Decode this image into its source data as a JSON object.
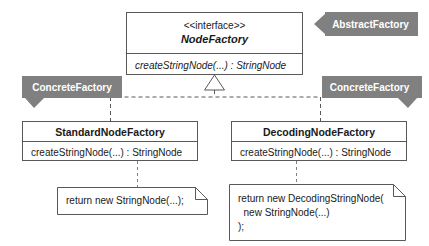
{
  "diagram": {
    "type": "uml-class-diagram",
    "colors": {
      "banner_fill": "#808080",
      "box_stroke": "#595959",
      "background": "#ffffff",
      "text": "#1a1a1a",
      "banner_text": "#ffffff"
    }
  },
  "interface": {
    "stereotype": "<<interface>>",
    "name": "NodeFactory",
    "operations": [
      "createStringNode(...) : StringNode"
    ],
    "role_label": "AbstractFactory"
  },
  "classes": [
    {
      "name": "StandardNodeFactory",
      "operations": [
        "createStringNode(...) : StringNode"
      ],
      "role_label": "ConcreteFactory",
      "note_lines": [
        "return new StringNode(...);"
      ]
    },
    {
      "name": "DecodingNodeFactory",
      "operations": [
        "createStringNode(...) : StringNode"
      ],
      "role_label": "ConcreteFactory",
      "note_lines": [
        "return new DecodingStringNode(",
        "  new StringNode(...)",
        ");"
      ]
    }
  ],
  "relationships": {
    "realization_label": "realization",
    "note_link_label": "note-anchor"
  }
}
